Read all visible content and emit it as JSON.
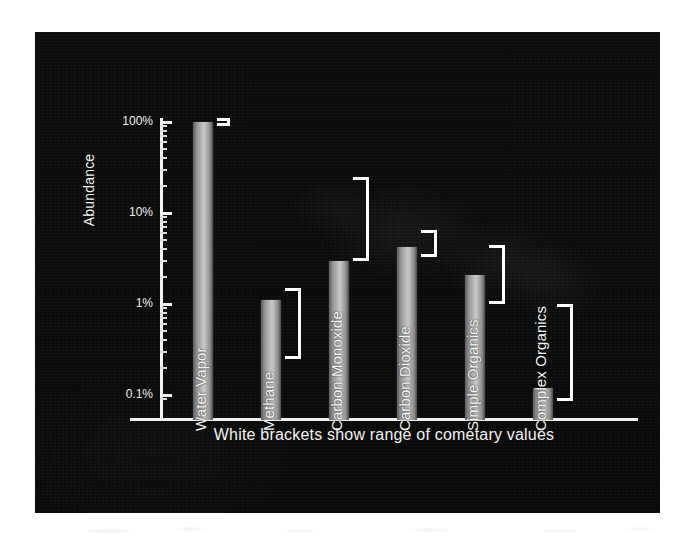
{
  "figure": {
    "background_color": "#ffffff",
    "panel_color": "#0a0a0a",
    "bracket_color": "#ffffff",
    "text_color": "#f2f2f2",
    "caption": "White brackets show range of cometary values"
  },
  "chart_data": {
    "type": "bar",
    "title": "",
    "xlabel": "",
    "ylabel": "Abundance",
    "yscale": "log",
    "ylim": [
      0.08,
      130
    ],
    "grid": false,
    "legend": "none",
    "ytick_labels": [
      "100%",
      "10%",
      "1%",
      "0.1%"
    ],
    "ytick_values": [
      100,
      10,
      1,
      0.1
    ],
    "categories": [
      "Water Vapor",
      "Methane",
      "Carbon Monoxide",
      "Carbon Dioxide",
      "Simple Organics",
      "Complex Organics"
    ],
    "values": [
      100,
      1.1,
      3.0,
      4.2,
      2.1,
      0.12
    ],
    "value_units": "percent",
    "series": [
      {
        "name": "Abundance",
        "values": [
          100,
          1.1,
          3.0,
          4.2,
          2.1,
          0.12
        ]
      }
    ],
    "brackets": {
      "description": "White brackets show range of cometary values",
      "ranges": [
        {
          "category": "Water Vapor",
          "low": 90,
          "high": 110
        },
        {
          "category": "Methane",
          "low": 0.25,
          "high": 1.5
        },
        {
          "category": "Carbon Monoxide",
          "low": 3.0,
          "high": 25
        },
        {
          "category": "Carbon Dioxide",
          "low": 3.3,
          "high": 6.5
        },
        {
          "category": "Simple Organics",
          "low": 1.0,
          "high": 4.5
        },
        {
          "category": "Complex Organics",
          "low": 0.085,
          "high": 1.0
        }
      ]
    },
    "annotations": [
      "White brackets show range of cometary values"
    ]
  }
}
